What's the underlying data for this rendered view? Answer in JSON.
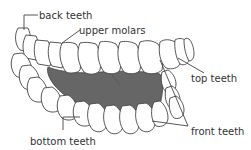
{
  "diagram": {
    "colors": {
      "tooth_fill": "#ffffff",
      "outline": "#444444",
      "mouth_interior": "#666666",
      "label_text": "#333333"
    },
    "labels": {
      "back_teeth": "back teeth",
      "upper_molars": "upper molars",
      "top_teeth": "top teeth",
      "front_teeth": "front teeth",
      "bottom_teeth": "bottom teeth"
    }
  }
}
